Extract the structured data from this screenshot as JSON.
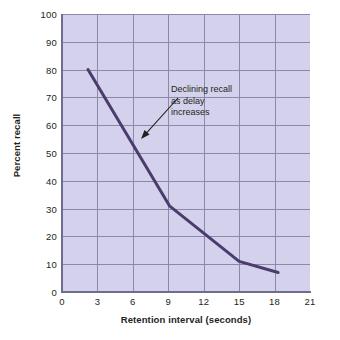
{
  "chart_data": {
    "type": "line",
    "title": "",
    "xlabel": "Retention interval (seconds)",
    "ylabel": "Percent recall",
    "xlim": [
      0,
      21
    ],
    "ylim": [
      0,
      100
    ],
    "grid": true,
    "legend": null,
    "xticks": [
      "0",
      "3",
      "6",
      "9",
      "12",
      "15",
      "18",
      "21"
    ],
    "xtick_values": [
      0,
      3,
      6,
      9,
      12,
      15,
      18,
      21
    ],
    "yticks": [
      "0",
      "10",
      "20",
      "30",
      "40",
      "50",
      "60",
      "70",
      "80",
      "90",
      "100"
    ],
    "ytick_values": [
      0,
      10,
      20,
      30,
      40,
      50,
      60,
      70,
      80,
      90,
      100
    ],
    "series": [
      {
        "name": "Percent recall",
        "x": [
          2.2,
          9.1,
          15.0,
          18.3
        ],
        "values": [
          80,
          31,
          11,
          7
        ],
        "color": "#4b3c6e",
        "line_width": 3
      }
    ],
    "annotations": [
      {
        "text_lines": [
          "Declining recall",
          "as delay",
          "increases"
        ],
        "arrow_from": [
          178,
          98
        ],
        "arrow_to": [
          141,
          139
        ]
      }
    ],
    "colors": {
      "plot_background": "#d4d1ec",
      "gridline": "#8b89a8",
      "axis": "#6f6d8d",
      "curve": "#4b3c6e",
      "text": "#231f20",
      "page_background": "#ffffff"
    }
  }
}
